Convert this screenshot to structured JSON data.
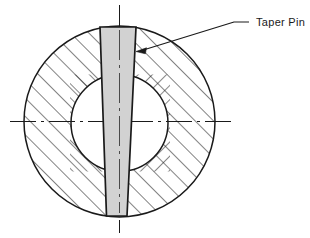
{
  "drawing": {
    "title": "Taper pin through hub and shaft — sectional end view",
    "background_color": "#ffffff",
    "line_color": "#1a1a1a",
    "hatch_color": "#1a1a1a",
    "pin_fill_color": "#d2d2d2",
    "annotations": [
      {
        "id": "taper-pin",
        "label": "Taper Pin",
        "label_x": 256,
        "label_y": 26,
        "leader": {
          "horizontal_start_x": 249,
          "horizontal_end_x": 234,
          "y": 22,
          "elbow_x": 234,
          "arrow_x": 136,
          "arrow_y": 51
        }
      }
    ],
    "geometry": {
      "outer_circle": {
        "cx": 119.5,
        "cy": 121.5,
        "r": 95.5
      },
      "inner_circle": {
        "cx": 119.5,
        "cy": 123.0,
        "r": 48.5
      },
      "taper_pin": {
        "top_y": 27,
        "bottom_y": 216,
        "top_left_x": 100,
        "top_right_x": 136,
        "bottom_left_x": 106.5,
        "bottom_right_x": 127
      },
      "center_line_horizontal": {
        "x1": 10,
        "x2": 232,
        "y": 121.5
      },
      "center_line_vertical": {
        "x": 119.5,
        "y1": 5,
        "y2": 233
      },
      "hatch": {
        "outer_spacing": 13,
        "outer_direction": "up-right",
        "inner_spacing": 10,
        "inner_left_direction": "up-right",
        "inner_right_direction": "down-right"
      }
    }
  }
}
